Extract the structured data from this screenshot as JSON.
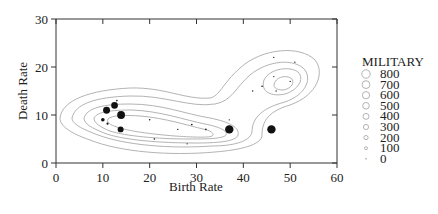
{
  "chart_data": {
    "type": "scatter",
    "subtype": "scatter with kernel density contours, point size mapped to MILITARY",
    "title": "",
    "xlabel": "Birth Rate",
    "ylabel": "Death Rate",
    "xlim": [
      0,
      60
    ],
    "ylim": [
      0,
      30
    ],
    "xticks": [
      0,
      10,
      20,
      30,
      40,
      50,
      60
    ],
    "yticks": [
      0,
      10,
      20,
      30
    ],
    "grid": false,
    "legend": {
      "title": "MILITARY",
      "position": "right",
      "entries": [
        "800",
        "700",
        "600",
        "500",
        "400",
        "300",
        "200",
        "100",
        "0"
      ]
    },
    "points": [
      {
        "x": 10.0,
        "y": 9.0,
        "size": 150
      },
      {
        "x": 10.8,
        "y": 11.0,
        "size": 550
      },
      {
        "x": 11.0,
        "y": 8.2,
        "size": 50
      },
      {
        "x": 12.5,
        "y": 12.0,
        "size": 500
      },
      {
        "x": 13.0,
        "y": 13.0,
        "size": 30
      },
      {
        "x": 13.9,
        "y": 10.0,
        "size": 700
      },
      {
        "x": 13.8,
        "y": 7.0,
        "size": 400
      },
      {
        "x": 20.0,
        "y": 9.0,
        "size": 30
      },
      {
        "x": 21.0,
        "y": 5.0,
        "size": 30
      },
      {
        "x": 26.0,
        "y": 7.0,
        "size": 20
      },
      {
        "x": 28.0,
        "y": 4.0,
        "size": 20
      },
      {
        "x": 29.0,
        "y": 8.0,
        "size": 30
      },
      {
        "x": 32.0,
        "y": 7.0,
        "size": 30
      },
      {
        "x": 37.0,
        "y": 7.0,
        "size": 800
      },
      {
        "x": 37.0,
        "y": 9.0,
        "size": 20
      },
      {
        "x": 46.0,
        "y": 7.0,
        "size": 800
      },
      {
        "x": 42.0,
        "y": 15.0,
        "size": 20
      },
      {
        "x": 44.0,
        "y": 16.0,
        "size": 30
      },
      {
        "x": 47.0,
        "y": 15.0,
        "size": 20
      },
      {
        "x": 46.5,
        "y": 18.0,
        "size": 20
      },
      {
        "x": 50.0,
        "y": 17.0,
        "size": 20
      },
      {
        "x": 46.5,
        "y": 22.0,
        "size": 20
      },
      {
        "x": 51.0,
        "y": 21.0,
        "size": 20
      }
    ]
  }
}
